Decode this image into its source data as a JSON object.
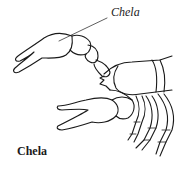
{
  "figure": {
    "callout_label": "Chela",
    "caption": "Chela",
    "line_color": "#1a1a1a",
    "background": "#ffffff"
  }
}
